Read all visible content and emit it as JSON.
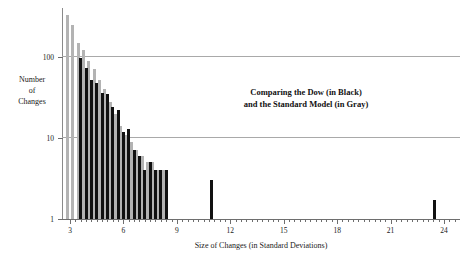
{
  "chart_data": {
    "type": "bar",
    "title": "",
    "xlabel": "Size of Changes (in Standard Deviations)",
    "ylabel_lines": [
      "Number",
      "of",
      "Changes"
    ],
    "ylabel": "Number of Changes",
    "yscale": "log",
    "ylim": [
      1,
      400
    ],
    "xlim": [
      2.55,
      24.9
    ],
    "grid": "horizontal-at-y-ticks",
    "legend_position": "inside-annotation",
    "annotation_lines": [
      "Comparing the Dow (in Black)",
      "and the Standard Model (in Gray)"
    ],
    "xticks": [
      3,
      6,
      9,
      12,
      15,
      18,
      21,
      24
    ],
    "xticklabels": [
      "3",
      "6",
      "9",
      "12",
      "15",
      "18",
      "21",
      "24"
    ],
    "xminorticks": [
      3.3,
      3.6,
      3.9,
      4.2,
      4.5,
      4.8,
      5.1,
      5.4,
      5.7,
      6.3,
      6.6,
      6.9,
      7.2,
      7.5,
      7.8,
      8.1,
      8.4,
      8.7,
      9.3,
      9.6,
      9.9,
      10.2,
      10.5,
      10.8,
      11.1,
      11.4,
      11.7,
      12.3,
      12.6,
      12.9,
      13.2,
      13.5,
      13.8,
      14.1,
      14.4,
      14.7,
      15.3,
      15.6,
      15.9,
      16.2,
      16.5,
      16.8,
      17.1,
      17.4,
      17.7,
      18.3,
      18.6,
      18.9,
      19.2,
      19.5,
      19.8,
      20.1,
      20.4,
      20.7,
      21.3,
      21.6,
      21.9,
      22.2,
      22.5,
      22.8,
      23.1,
      23.4,
      23.7,
      24.3,
      24.6
    ],
    "yticks": [
      1,
      10,
      100
    ],
    "yticklabels": [
      "1",
      "10",
      "100"
    ],
    "series": [
      {
        "name": "Standard Model",
        "color": "#b3b3b3",
        "legend_text": "in Gray",
        "x": [
          2.85,
          3.15,
          3.45,
          3.75,
          4.05,
          4.35,
          4.65,
          4.95,
          5.25,
          5.55,
          5.85,
          6.15,
          6.45,
          6.75,
          7.05,
          7.35,
          7.65,
          7.95,
          8.25
        ],
        "values": [
          330,
          250,
          148,
          120,
          88,
          70,
          52,
          40,
          28,
          20,
          14,
          11,
          9,
          7,
          6,
          5,
          5,
          4,
          4
        ]
      },
      {
        "name": "Dow",
        "color": "#111111",
        "legend_text": "in Black",
        "x": [
          3.6,
          3.9,
          4.2,
          4.5,
          4.8,
          5.1,
          5.4,
          5.7,
          6.0,
          6.3,
          6.6,
          6.9,
          7.2,
          7.5,
          7.8,
          8.1,
          8.4,
          10.95,
          23.45
        ],
        "values": [
          97,
          72,
          52,
          48,
          36,
          35,
          24,
          22,
          12,
          13,
          7,
          6,
          4,
          5,
          4,
          4,
          4,
          3,
          1.7
        ]
      }
    ]
  }
}
